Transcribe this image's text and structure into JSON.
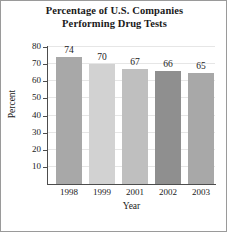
{
  "chart_data": {
    "type": "bar",
    "title": "Percentage of U.S. Companies Performing Drug Tests",
    "title_lines": [
      "Percentage of U.S. Companies",
      "Performing Drug Tests"
    ],
    "xlabel": "Year",
    "ylabel": "Percent",
    "categories": [
      "1998",
      "1999",
      "2001",
      "2002",
      "2003"
    ],
    "values": [
      74,
      70,
      67,
      66,
      65
    ],
    "value_labels": [
      "74",
      "70",
      "67",
      "66",
      "65"
    ],
    "ylim": [
      0,
      80
    ],
    "yticks": [
      10,
      20,
      30,
      40,
      50,
      60,
      70,
      80
    ],
    "ytick_labels": [
      "10",
      "20",
      "30",
      "40",
      "50",
      "60",
      "70",
      "80"
    ],
    "grid": "horizontal",
    "legend": "none",
    "bar_colors": [
      "#a8a8a8",
      "#d2d2d2",
      "#bfbfbf",
      "#8f8f8f",
      "#a8a8a8"
    ],
    "axis_color": "#4d4d4d",
    "grid_color": "#e6e6e6",
    "background": "#ffffff",
    "border_color": "#9a9a9a"
  }
}
